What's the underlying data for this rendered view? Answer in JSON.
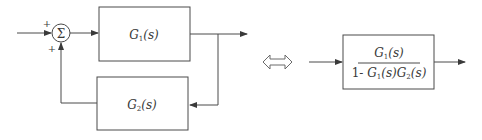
{
  "diagram": {
    "summing_junction": {
      "symbol": "Σ",
      "input_sign_top": "+",
      "input_sign_bottom": "+"
    },
    "forward_block": {
      "name": "G",
      "sub": "1",
      "arg": "(s)"
    },
    "feedback_block": {
      "name": "G",
      "sub": "2",
      "arg": "(s)"
    },
    "equivalence_symbol": "⇔",
    "equivalent_block": {
      "numerator": {
        "name": "G",
        "sub": "1",
        "arg": "(s)"
      },
      "denominator": {
        "prefix": "1- ",
        "t1": {
          "name": "G",
          "sub": "1",
          "arg": "(s)"
        },
        "t2": {
          "name": "G",
          "sub": "2",
          "arg": "(s)"
        }
      }
    },
    "colors": {
      "stroke": "#4a4a4a",
      "text": "#3a3a3a"
    }
  }
}
